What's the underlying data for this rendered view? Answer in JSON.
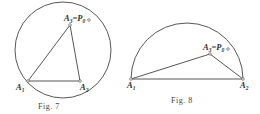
{
  "figures": [
    {
      "id": "fig7",
      "caption": "Fig. 7",
      "shape": "circle",
      "points": {
        "A1": {
          "label": "A",
          "sub": "1"
        },
        "A2": {
          "label": "A",
          "sub": "2"
        },
        "A3": {
          "label": "A",
          "sub": "3",
          "suffix": "=P",
          "suffix_sub": "0"
        }
      },
      "edges": [
        [
          "A1",
          "A3"
        ],
        [
          "A3",
          "A2"
        ],
        [
          "A1",
          "A2"
        ]
      ]
    },
    {
      "id": "fig8",
      "caption": "Fig. 8",
      "shape": "semicircle",
      "points": {
        "A1": {
          "label": "A",
          "sub": "1"
        },
        "A2": {
          "label": "A",
          "sub": "2"
        },
        "A3": {
          "label": "A",
          "sub": "3",
          "suffix": "=P",
          "suffix_sub": "0"
        }
      },
      "edges": [
        [
          "A1",
          "A3"
        ],
        [
          "A3",
          "A2"
        ],
        [
          "A1",
          "A2"
        ]
      ]
    }
  ],
  "colors": {
    "stroke": "#333333",
    "background": "#ffffff"
  }
}
